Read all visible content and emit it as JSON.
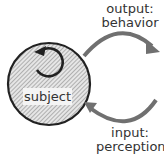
{
  "diagram": {
    "subject": {
      "label": "subject",
      "fill_pattern": "diagonal-hatch",
      "stroke_color": "#222222"
    },
    "self_loop_arrow": {
      "direction": "counterclockwise",
      "color": "#222222"
    },
    "output_arrow": {
      "line1": "output:",
      "line2": "behavior",
      "color": "#707070"
    },
    "input_arrow": {
      "line1": "input:",
      "line2": "perception",
      "color": "#707070"
    }
  }
}
